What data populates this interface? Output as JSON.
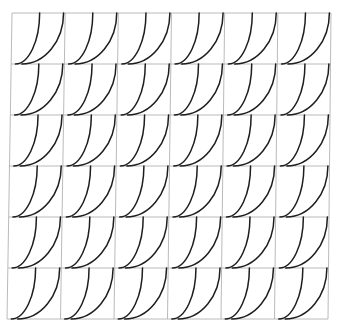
{
  "diagram": {
    "type": "tiled-pattern",
    "rows": 6,
    "cols": 6,
    "colors": {
      "background": "#ffffff",
      "grid": "#a8a8a8",
      "curve": "#1e1e1e"
    },
    "corners": {
      "top_left": [
        12,
        13
      ],
      "top_right": [
        331,
        13
      ],
      "bottom_left": [
        7,
        319
      ],
      "bottom_right": [
        328,
        319
      ]
    },
    "cell_motif": {
      "description": "two concave quarter-curves per cell, horizontal at the bottom, vertical at the top",
      "curves": [
        {
          "start": [
            0.08,
            1.0
          ],
          "end": [
            0.52,
            0.0
          ]
        },
        {
          "start": [
            0.2,
            1.0
          ],
          "end": [
            0.97,
            0.0
          ]
        }
      ]
    }
  }
}
